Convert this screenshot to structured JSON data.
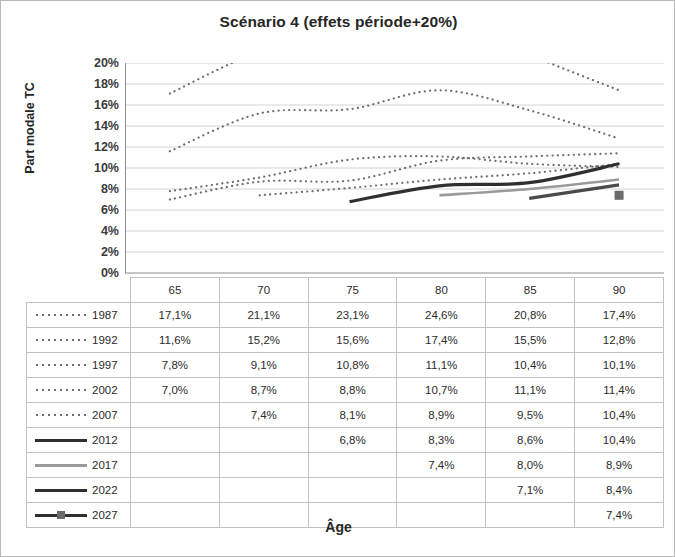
{
  "chart_data": {
    "type": "line",
    "title": "Scénario 4 (effets période+20%)",
    "xlabel": "Âge",
    "ylabel": "Part modale TC",
    "categories": [
      "65",
      "70",
      "75",
      "80",
      "85",
      "90"
    ],
    "ylim": [
      0,
      0.2
    ],
    "ytick_labels": [
      "20%",
      "18%",
      "16%",
      "14%",
      "12%",
      "10%",
      "8%",
      "6%",
      "4%",
      "2%",
      "0%"
    ],
    "ytick_values": [
      20,
      18,
      16,
      14,
      12,
      10,
      8,
      6,
      4,
      2,
      0
    ],
    "grid": true,
    "legend_position": "table-left-column",
    "series": [
      {
        "name": "1987",
        "style": "dotted",
        "color": "#6e6e6e",
        "values": [
          17.1,
          21.1,
          23.1,
          24.6,
          20.8,
          17.4
        ],
        "labels": [
          "17,1%",
          "21,1%",
          "23,1%",
          "24,6%",
          "20,8%",
          "17,4%"
        ]
      },
      {
        "name": "1992",
        "style": "dotted",
        "color": "#6e6e6e",
        "values": [
          11.6,
          15.2,
          15.6,
          17.4,
          15.5,
          12.8
        ],
        "labels": [
          "11,6%",
          "15,2%",
          "15,6%",
          "17,4%",
          "15,5%",
          "12,8%"
        ]
      },
      {
        "name": "1997",
        "style": "dotted",
        "color": "#6e6e6e",
        "values": [
          7.8,
          9.1,
          10.8,
          11.1,
          10.4,
          10.1
        ],
        "labels": [
          "7,8%",
          "9,1%",
          "10,8%",
          "11,1%",
          "10,4%",
          "10,1%"
        ]
      },
      {
        "name": "2002",
        "style": "dotted",
        "color": "#6e6e6e",
        "values": [
          7.0,
          8.7,
          8.8,
          10.7,
          11.1,
          11.4
        ],
        "labels": [
          "7,0%",
          "8,7%",
          "8,8%",
          "10,7%",
          "11,1%",
          "11,4%"
        ]
      },
      {
        "name": "2007",
        "style": "dotted",
        "color": "#6e6e6e",
        "values": [
          null,
          7.4,
          8.1,
          8.9,
          9.5,
          10.4
        ],
        "labels": [
          "",
          "7,4%",
          "8,1%",
          "8,9%",
          "9,5%",
          "10,4%"
        ]
      },
      {
        "name": "2012",
        "style": "solid-dark",
        "color": "#2f2f2f",
        "values": [
          null,
          null,
          6.8,
          8.3,
          8.6,
          10.4
        ],
        "labels": [
          "",
          "",
          "6,8%",
          "8,3%",
          "8,6%",
          "10,4%"
        ]
      },
      {
        "name": "2017",
        "style": "solid-gray",
        "color": "#9a9a9a",
        "values": [
          null,
          null,
          null,
          7.4,
          8.0,
          8.9
        ],
        "labels": [
          "",
          "",
          "",
          "7,4%",
          "8,0%",
          "8,9%"
        ]
      },
      {
        "name": "2022",
        "style": "solid-dark",
        "color": "#4a4a4a",
        "values": [
          null,
          null,
          null,
          null,
          7.1,
          8.4
        ],
        "labels": [
          "",
          "",
          "",
          "",
          "7,1%",
          "8,4%"
        ]
      },
      {
        "name": "2027",
        "style": "solid-sq",
        "color": "#2f2f2f",
        "values": [
          null,
          null,
          null,
          null,
          null,
          7.4
        ],
        "labels": [
          "",
          "",
          "",
          "",
          "",
          "7,4%"
        ]
      }
    ]
  },
  "table": {
    "header_row": [
      "",
      "65",
      "70",
      "75",
      "80",
      "85",
      "90"
    ]
  }
}
